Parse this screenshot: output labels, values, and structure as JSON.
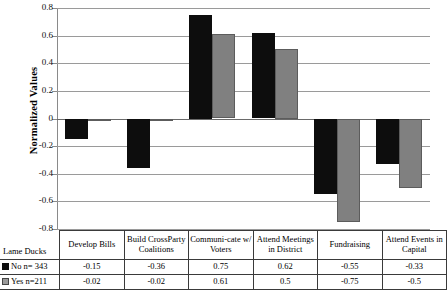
{
  "chart_data": {
    "type": "bar",
    "title": "",
    "xlabel": "",
    "ylabel": "Normalized Values",
    "ylim": [
      -0.8,
      0.8
    ],
    "ytick_labels": [
      "0.8",
      "0.6",
      "0.4",
      "0.2",
      "0",
      "-0.2",
      "-0.4",
      "-0.6",
      "-0.8"
    ],
    "ytick_values": [
      0.8,
      0.6,
      0.4,
      0.2,
      0,
      -0.2,
      -0.4,
      -0.6,
      -0.8
    ],
    "grid": true,
    "legend_position": "table-left",
    "legend_title": "Lame Ducks",
    "categories": [
      "Develop Bills",
      "Build CrossParty Coalitions",
      "Communi-cate w/ Voters",
      "Attend Meetings in District",
      "Fundraising",
      "Attend Events in Capital"
    ],
    "series": [
      {
        "name": "No n= 343",
        "color": "#0d0d0d",
        "values": [
          -0.15,
          -0.36,
          0.75,
          0.62,
          -0.55,
          -0.33
        ]
      },
      {
        "name": "Yes n=211",
        "color": "#808080",
        "values": [
          -0.02,
          -0.02,
          0.61,
          0.5,
          -0.75,
          -0.5
        ]
      }
    ]
  },
  "table": {
    "corner_label": "Lame Ducks",
    "column_headers": [
      "Develop Bills",
      "Build CrossParty Coalitions",
      "Communi-cate w/ Voters",
      "Attend Meetings in District",
      "Fundraising",
      "Attend Events in Capital"
    ],
    "rows": [
      {
        "label": "No n= 343",
        "swatch": "black",
        "values": [
          "-0.15",
          "-0.36",
          "0.75",
          "0.62",
          "-0.55",
          "-0.33"
        ]
      },
      {
        "label": "Yes n=211",
        "swatch": "gray",
        "values": [
          "-0.02",
          "-0.02",
          "0.61",
          "0.5",
          "-0.75",
          "-0.5"
        ]
      }
    ]
  }
}
